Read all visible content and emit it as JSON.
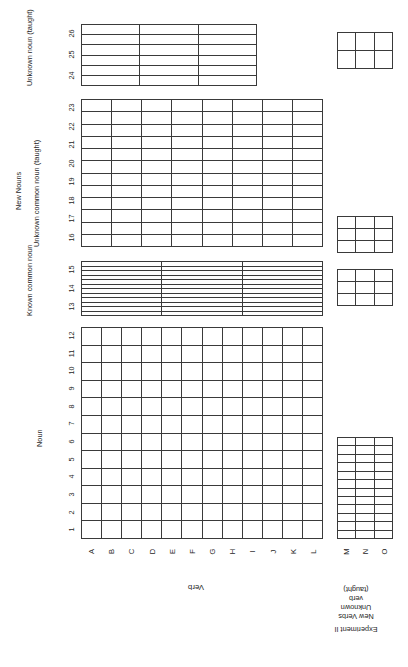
{
  "figure": {
    "experiment_label": "Experiment II",
    "axis_title_vertical": "Verb",
    "axis_title_horizontal_groups": {
      "noun": "Noun",
      "new_nouns": "New Nouns"
    }
  },
  "column_group_labels": {
    "noun": "Noun",
    "new_nouns": "New Nouns",
    "known_common_noun": "Known\ncommon\nnoun",
    "unknown_common_noun": "Unknown common noun\n(taught)",
    "unknown_noun_taught": "Unknown\nnoun\n(taught)"
  },
  "row_group_labels": {
    "verb": "Verb",
    "new_verbs": "New Verbs",
    "unknown_verb_taught": "Unknown\nverb\n(taught)",
    "experiment": "Experiment II"
  },
  "column_numbers": {
    "noun": [
      "1",
      "2",
      "3",
      "4",
      "5",
      "6",
      "7",
      "8",
      "9",
      "10",
      "11",
      "12"
    ],
    "known_common_noun": [
      "13",
      "14",
      "15"
    ],
    "unknown_common_noun": [
      "16",
      "17",
      "18",
      "19",
      "20",
      "21",
      "22",
      "23"
    ],
    "unknown_noun_taught": [
      "24",
      "25",
      "26"
    ]
  },
  "row_letters": {
    "verb": [
      "A",
      "B",
      "C",
      "D",
      "E",
      "F",
      "G",
      "H",
      "I",
      "J",
      "K",
      "L"
    ],
    "new_verbs": [
      "M",
      "N",
      "O"
    ]
  },
  "grids": [
    {
      "name": "noun-verb-grid",
      "cols": 12,
      "rows": 12
    },
    {
      "name": "known-noun-verb-grid",
      "cols": 3,
      "rows": 12
    },
    {
      "name": "unknown-common-noun-grid",
      "cols": 8,
      "rows": 12
    },
    {
      "name": "unknown-noun-taught-grid",
      "cols": 6,
      "rows": 3
    },
    {
      "name": "noun-newverb-grid",
      "cols": 12,
      "rows": 3
    },
    {
      "name": "known-noun-newverb-grid",
      "cols": 3,
      "rows": 3
    },
    {
      "name": "unknown-common-newverb-grid",
      "cols": 3,
      "rows": 3
    },
    {
      "name": "unknown-taught-newverb-grid",
      "cols": 3,
      "rows": 2
    }
  ],
  "colors": {
    "line": "#3a3a3a",
    "text": "#262626",
    "background": "#ffffff"
  }
}
